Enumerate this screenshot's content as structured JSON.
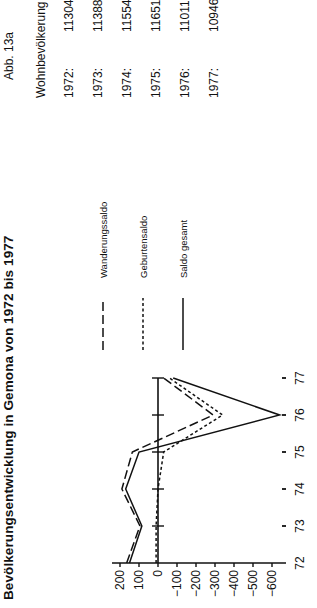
{
  "figure": {
    "title": "Bevölkerungsentwicklung in Gemona von 1972 bis 1977",
    "label": "Abb. 13a"
  },
  "population": {
    "header": "Wohnbevölkerung :",
    "rows": [
      {
        "year": "1972:",
        "value": "11304"
      },
      {
        "year": "1973:",
        "value": "11388"
      },
      {
        "year": "1974:",
        "value": "11554"
      },
      {
        "year": "1975:",
        "value": "11651"
      },
      {
        "year": "1976:",
        "value": "11011"
      },
      {
        "year": "1977:",
        "value": "10946"
      }
    ]
  },
  "chart_data": {
    "type": "line",
    "title": "Bevölkerungsentwicklung in Gemona von 1972 bis 1977",
    "xlabel": "",
    "ylabel": "",
    "x": [
      "72",
      "73",
      "74",
      "75",
      "76",
      "77"
    ],
    "ylim": [
      -600,
      200
    ],
    "yticks": [
      "200",
      "100",
      "0",
      "−100",
      "−200",
      "−300",
      "−400",
      "−500",
      "−600"
    ],
    "ytick_values": [
      200,
      100,
      0,
      -100,
      -200,
      -300,
      -400,
      -500,
      -600
    ],
    "grid": false,
    "orientation": "rotated 90° counter-clockwise",
    "legend_position": "right",
    "series": [
      {
        "name": "Wanderungssaldo",
        "style": "long-dash",
        "values": [
          165,
          95,
          190,
          135,
          -290,
          -30
        ]
      },
      {
        "name": "Geburtensaldo",
        "style": "short-dash",
        "values": [
          10,
          10,
          0,
          -30,
          -340,
          -60
        ]
      },
      {
        "name": "Saldo gesamt",
        "style": "solid",
        "values": [
          150,
          85,
          170,
          100,
          -640,
          -80
        ]
      }
    ]
  }
}
